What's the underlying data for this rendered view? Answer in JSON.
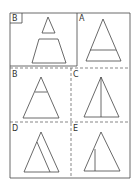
{
  "figure": {
    "stimulus_label": "B",
    "options": [
      {
        "label": "A",
        "description": "triangle with horizontal line near base"
      },
      {
        "label": "B",
        "description": "triangle with horizontal line near apex"
      },
      {
        "label": "C",
        "description": "triangle with vertical line from apex to base"
      },
      {
        "label": "D",
        "description": "triangle with slanted inner line parallel to right side"
      },
      {
        "label": "E",
        "description": "triangle with short vertical line left of center"
      }
    ]
  },
  "colors": {
    "line": "#444444",
    "background": "#ffffff"
  }
}
